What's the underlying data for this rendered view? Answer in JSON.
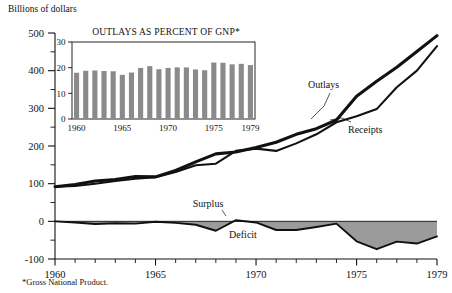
{
  "header": {
    "units_label": "Billions of dollars"
  },
  "footnote": {
    "text": "*Gross National Product."
  },
  "labels": {
    "outlays": "Outlays",
    "receipts": "Receipts",
    "surplus": "Surplus",
    "deficit": "Deficit"
  },
  "colors": {
    "ink": "#111111",
    "bar_fill": "#8a8a8a",
    "deficit_fill": "#9b9b9b",
    "background": "#ffffff"
  },
  "chart_data": [
    {
      "type": "line",
      "id": "main-budget-chart",
      "title": "",
      "xlabel": "",
      "ylabel": "Billions of dollars",
      "xlim": [
        1960,
        1979
      ],
      "ylim": [
        -100,
        500
      ],
      "ytick_labels": [
        "500",
        "400",
        "300",
        "200",
        "100",
        "0",
        "-100"
      ],
      "yticks": [
        500,
        400,
        300,
        200,
        100,
        0,
        -100
      ],
      "yminor_step": 50,
      "xtick_labels": [
        "1960",
        "1965",
        "1970",
        "1975",
        "1979"
      ],
      "xticks": [
        1960,
        1965,
        1970,
        1975,
        1979
      ],
      "xminor_step": 1,
      "grid": false,
      "legend_position": "inline-annotation",
      "x": [
        1960,
        1961,
        1962,
        1963,
        1964,
        1965,
        1966,
        1967,
        1968,
        1969,
        1970,
        1971,
        1972,
        1973,
        1974,
        1975,
        1976,
        1977,
        1978,
        1979
      ],
      "series": [
        {
          "name": "Outlays",
          "values": [
            92,
            98,
            107,
            111,
            119,
            118,
            135,
            158,
            179,
            184,
            196,
            210,
            231,
            246,
            269,
            332,
            372,
            409,
            451,
            493
          ]
        },
        {
          "name": "Receipts",
          "values": [
            92,
            94,
            100,
            107,
            113,
            117,
            131,
            149,
            153,
            187,
            193,
            187,
            207,
            231,
            263,
            279,
            298,
            356,
            400,
            465
          ]
        },
        {
          "name": "Surplus or Deficit",
          "values": [
            0,
            -3,
            -7,
            -5,
            -6,
            -1,
            -4,
            -9,
            -25,
            3,
            -3,
            -23,
            -23,
            -15,
            -6,
            -53,
            -74,
            -54,
            -59,
            -40
          ]
        }
      ],
      "annotations": [
        {
          "text": "Outlays",
          "x": 1973.2,
          "y": 330
        },
        {
          "text": "Receipts",
          "x": 1975.4,
          "y": 250
        },
        {
          "text": "Surplus",
          "x": 1968.9,
          "y": 35
        },
        {
          "text": "Deficit",
          "x": 1970.8,
          "y": -48
        }
      ]
    },
    {
      "type": "bar",
      "id": "inset-outlays-percent-gnp",
      "title": "OUTLAYS AS PERCENT OF GNP*",
      "xlabel": "",
      "ylabel": "",
      "ylim": [
        0,
        30
      ],
      "yticks": [
        0,
        10,
        20,
        30
      ],
      "ytick_labels": [
        "0",
        "10",
        "20",
        "30"
      ],
      "xtick_labels": [
        "1960",
        "1965",
        "1970",
        "1975",
        "1979"
      ],
      "xticks": [
        1960,
        1965,
        1970,
        1975,
        1979
      ],
      "grid": false,
      "categories": [
        1960,
        1961,
        1962,
        1963,
        1964,
        1965,
        1966,
        1967,
        1968,
        1969,
        1970,
        1971,
        1972,
        1973,
        1974,
        1975,
        1976,
        1977,
        1978,
        1979
      ],
      "values": [
        18.0,
        18.8,
        18.9,
        18.7,
        18.6,
        17.2,
        18.1,
        19.9,
        20.6,
        19.4,
        19.9,
        20.1,
        20.1,
        19.3,
        19.0,
        22.0,
        21.9,
        21.3,
        21.5,
        21.0
      ]
    }
  ]
}
